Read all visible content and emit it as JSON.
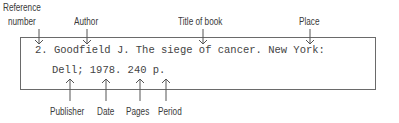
{
  "labels_top": {
    "reference_number_line1": "Reference",
    "reference_number_line2": "number",
    "author": "Author",
    "title": "Title of book",
    "place": "Place"
  },
  "citation": {
    "line1": "2. Goodfield J. The siege of cancer. New York:",
    "line2": "Dell; 1978. 240 p."
  },
  "labels_bottom": {
    "publisher": "Publisher",
    "date": "Date",
    "pages": "Pages",
    "period": "Period"
  }
}
